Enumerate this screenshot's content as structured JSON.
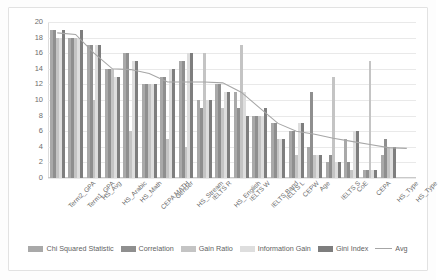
{
  "chart_data": {
    "type": "bar",
    "title": "",
    "xlabel": "",
    "ylabel": "",
    "ylim": [
      0,
      20
    ],
    "ytick_step": 2,
    "yticks": [
      "0",
      "2",
      "4",
      "6",
      "8",
      "10",
      "12",
      "14",
      "16",
      "18",
      "20"
    ],
    "grid": true,
    "legend_position": "bottom",
    "categories": [
      "Term2_GPA",
      "Term1_GPA",
      "HS_Avg",
      "HS_Arabic",
      "HS_Math",
      "CEPA MATH",
      "Gender",
      "HS_Stream",
      "IELTS R",
      "HS_English",
      "IELTS W",
      "IELTS Band",
      "IELTS L",
      "CEPW",
      "Age",
      "IELTS S",
      "CoE",
      "CEPA",
      "HS_Type",
      "HS_Type"
    ],
    "series": [
      {
        "name": "Chi Squared Statistic",
        "color": "#a9a9a9",
        "values": [
          19,
          18,
          17,
          14,
          16,
          12,
          13,
          15,
          10,
          12,
          11,
          8,
          7,
          6,
          4,
          2,
          5,
          1,
          3,
          0
        ]
      },
      {
        "name": "Correlation",
        "color": "#8f8f8f",
        "values": [
          19,
          18,
          17,
          14,
          16,
          12,
          13,
          15,
          9,
          12,
          9,
          8,
          7,
          6,
          11,
          3,
          2,
          1,
          5,
          0
        ]
      },
      {
        "name": "Gain Ratio",
        "color": "#c4c4c4",
        "values": [
          18,
          18,
          10,
          14,
          6,
          12,
          5,
          4,
          16,
          9,
          17,
          8,
          5,
          3,
          3,
          13,
          1,
          15,
          4,
          0
        ]
      },
      {
        "name": "Information Gain",
        "color": "#dedede",
        "values": [
          18,
          18,
          17,
          13,
          15,
          12,
          14,
          16,
          10,
          11,
          11,
          8,
          5,
          7,
          3,
          2,
          6,
          1,
          4,
          0
        ]
      },
      {
        "name": "Gini Index",
        "color": "#7e7e7e",
        "values": [
          19,
          19,
          17,
          13,
          15,
          12,
          14,
          16,
          10,
          11,
          8,
          9,
          5,
          7,
          3,
          2,
          6,
          1,
          4,
          0
        ]
      }
    ],
    "line_series": {
      "name": "Avg",
      "color": "#a6a6a6",
      "values": [
        18.6,
        18.4,
        16.0,
        14.0,
        13.9,
        13.4,
        12.3,
        12.3,
        12.3,
        12.2,
        11.0,
        9.0,
        7.0,
        6.0,
        5.6,
        5.1,
        4.7,
        4.3,
        3.9,
        3.8
      ]
    }
  },
  "legend": {
    "items": [
      {
        "label": "Chi Squared Statistic",
        "type": "bar"
      },
      {
        "label": "Correlation",
        "type": "bar"
      },
      {
        "label": "Gain Ratio",
        "type": "bar"
      },
      {
        "label": "Information Gain",
        "type": "bar"
      },
      {
        "label": "Gini Index",
        "type": "bar"
      },
      {
        "label": "Avg",
        "type": "line"
      }
    ]
  }
}
